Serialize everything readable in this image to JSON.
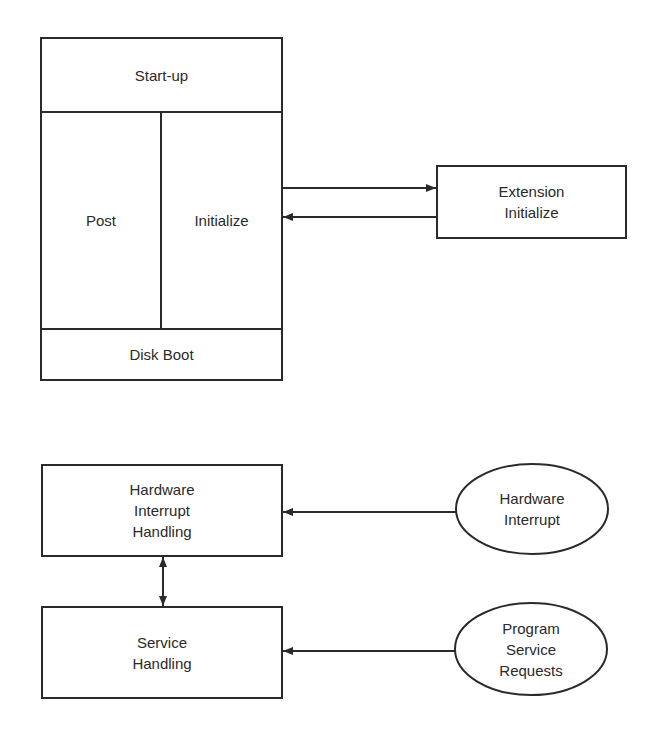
{
  "diagram": {
    "boot_block": {
      "startup_label": "Start-up",
      "post_label": "Post",
      "initialize_label": "Initialize",
      "disk_boot_label": "Disk Boot"
    },
    "extension_box": {
      "label": "Extension\nInitialize"
    },
    "hardware_interrupt_handling": {
      "label": "Hardware\nInterrupt\nHandling"
    },
    "service_handling": {
      "label": "Service\nHandling"
    },
    "hardware_interrupt_source": {
      "label": "Hardware\nInterrupt"
    },
    "program_service_requests": {
      "label": "Program\nService\nRequests"
    },
    "colors": {
      "stroke": "#2a2a2a",
      "background": "#ffffff"
    }
  }
}
